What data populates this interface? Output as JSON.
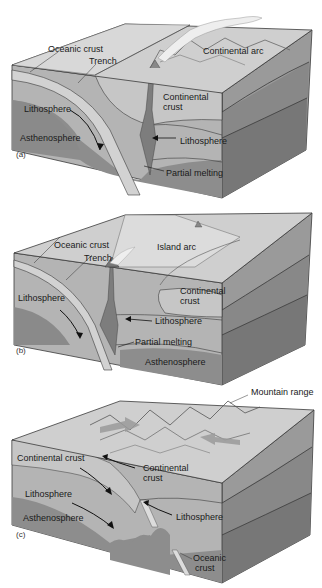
{
  "figure": {
    "panels": [
      {
        "tag": "(a)",
        "labels": {
          "oceanic_crust": "Oceanic crust",
          "trench": "Trench",
          "continental_arc": "Continental arc",
          "continental_crust_1": "Continental",
          "continental_crust_2": "crust",
          "lithosphere_left": "Lithosphere",
          "lithosphere_right": "Lithosphere",
          "asthenosphere": "Asthenosphere",
          "partial_melting": "Partial melting"
        }
      },
      {
        "tag": "(b)",
        "labels": {
          "oceanic_crust": "Oceanic crust",
          "trench": "Trench",
          "island_arc": "Island arc",
          "continental_crust_1": "Continental",
          "continental_crust_2": "crust",
          "lithosphere_left": "Lithosphere",
          "lithosphere_right": "Lithosphere",
          "partial_melting": "Partial melting",
          "asthenosphere": "Asthenosphere"
        }
      },
      {
        "tag": "(c)",
        "labels": {
          "mountain_range": "Mountain range",
          "continental_crust_left": "Continental crust",
          "continental_crust_right_1": "Continental",
          "continental_crust_right_2": "crust",
          "lithosphere_left": "Lithosphere",
          "lithosphere_right": "Lithosphere",
          "asthenosphere": "Asthenosphere",
          "oceanic_crust_1": "Oceanic",
          "oceanic_crust_2": "crust"
        }
      }
    ],
    "colors": {
      "top_surface": "#cfcfcf",
      "crust": "#bdbdbd",
      "lithosphere": "#a9a9a9",
      "asthenosphere": "#8a8a8a",
      "side_light": "#9a9a9a",
      "side_dark": "#777777",
      "outline": "#3a3a3a"
    }
  }
}
